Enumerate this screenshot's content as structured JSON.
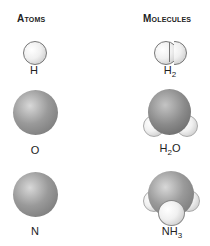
{
  "headers": {
    "atoms": "Atoms",
    "molecules": "Molecules"
  },
  "atoms": [
    {
      "label": "H"
    },
    {
      "label": "O"
    },
    {
      "label": "N"
    }
  ],
  "molecules": [
    {
      "label_main": "H",
      "label_sub": "2"
    },
    {
      "label_main": "H",
      "label_sub": "2",
      "label_tail": "O"
    },
    {
      "label_main": "NH",
      "label_sub": "3"
    }
  ]
}
